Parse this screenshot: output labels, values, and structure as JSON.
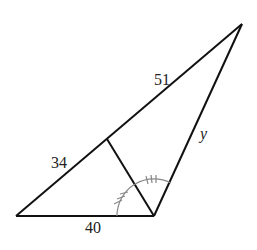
{
  "diagram": {
    "type": "triangle with angle bisector",
    "labels": {
      "hypotenuse_upper": "51",
      "hypotenuse_lower": "34",
      "base": "40",
      "right_side": "y"
    },
    "colors": {
      "lines": "#111111",
      "angle_arcs": "#888888"
    }
  }
}
